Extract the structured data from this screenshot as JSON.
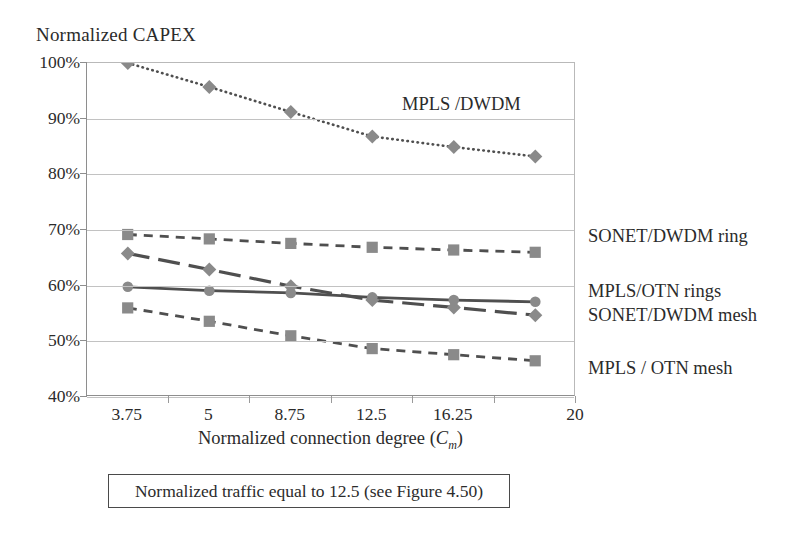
{
  "axis": {
    "y_title": "Normalized CAPEX",
    "x_title_prefix": "Normalized connection degree (",
    "x_title_var": "C",
    "x_title_sub": "m",
    "x_title_suffix": ")"
  },
  "caption": "Normalized traffic equal to 12.5 (see Figure 4.50)",
  "annotations": {
    "mpls_dwdm": "MPLS /DWDM",
    "sonet_dwdm_ring": "SONET/DWDM ring",
    "mpls_otn_rings": "MPLS/OTN rings",
    "sonet_dwdm_mesh": "SONET/DWDM mesh",
    "mpls_otn_mesh": "MPLS / OTN mesh"
  },
  "colors": {
    "marker_gray": "#8a8a8a",
    "line_dark": "#4f4f4f",
    "grid": "#c2c2c2",
    "axis": "#8e8e8e",
    "text": "#2b2b2b"
  },
  "chart_data": {
    "type": "line",
    "title": "",
    "xlabel": "Normalized connection degree (Cm)",
    "ylabel": "Normalized CAPEX",
    "xlim": [
      1.25,
      20
    ],
    "ylim": [
      40,
      100
    ],
    "ytick_labels": [
      "100%",
      "90%",
      "80%",
      "70%",
      "60%",
      "50%",
      "40%"
    ],
    "ytick_values": [
      100,
      90,
      80,
      70,
      60,
      50,
      40
    ],
    "xtick_labels": [
      "3.75",
      "5",
      "8.75",
      "12.5",
      "16.25",
      "20"
    ],
    "xtick_values": [
      3.75,
      5,
      8.75,
      12.5,
      16.25,
      20
    ],
    "grid": "horizontal",
    "legend": "inline-annotations",
    "x": [
      2.5,
      4.375,
      6.25,
      10.5,
      13.75,
      18.1
    ],
    "series": [
      {
        "name": "MPLS /DWDM",
        "marker": "diamond",
        "linestyle": "dotted",
        "values": [
          100.0,
          95.7,
          91.2,
          86.8,
          84.9,
          83.2
        ]
      },
      {
        "name": "SONET/DWDM ring",
        "marker": "square",
        "linestyle": "dashed",
        "values": [
          69.2,
          68.4,
          67.6,
          66.9,
          66.4,
          66.0
        ]
      },
      {
        "name": "SONET/DWDM mesh",
        "marker": "diamond",
        "linestyle": "long-dash",
        "values": [
          65.8,
          62.9,
          59.9,
          57.4,
          56.1,
          54.7
        ]
      },
      {
        "name": "MPLS/OTN rings",
        "marker": "circle",
        "linestyle": "solid",
        "values": [
          59.8,
          59.1,
          58.7,
          57.9,
          57.4,
          57.1
        ]
      },
      {
        "name": "MPLS / OTN mesh",
        "marker": "square",
        "linestyle": "dashed",
        "values": [
          56.0,
          53.6,
          51.0,
          48.7,
          47.6,
          46.5
        ]
      }
    ]
  }
}
